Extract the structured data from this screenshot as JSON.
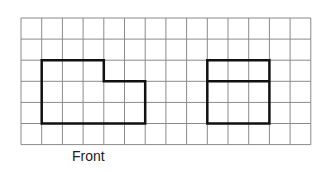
{
  "grid": {
    "origin_x": 21,
    "origin_y": 18,
    "cols": 14,
    "rows": 6,
    "cell_w": 20.7,
    "cell_h": 21.1,
    "line_color": "#8a8a8a",
    "shape_color": "#111111"
  },
  "views": [
    {
      "name": "Front",
      "label": "Front",
      "outline": [
        [
          1,
          2
        ],
        [
          4,
          2
        ],
        [
          4,
          3
        ],
        [
          6,
          3
        ],
        [
          6,
          5
        ],
        [
          1,
          5
        ]
      ],
      "dividers": []
    },
    {
      "name": "Side",
      "label": "Side",
      "outline": [
        [
          9,
          2
        ],
        [
          12,
          2
        ],
        [
          12,
          5
        ],
        [
          9,
          5
        ]
      ],
      "dividers": [
        [
          [
            9,
            3
          ],
          [
            12,
            3
          ]
        ]
      ]
    }
  ],
  "labels": {
    "front": "Front",
    "side": "Side"
  }
}
